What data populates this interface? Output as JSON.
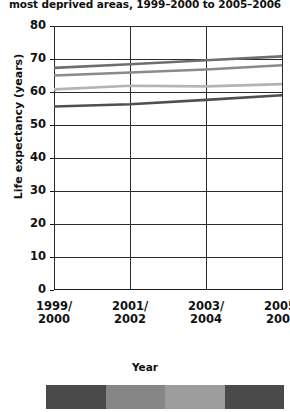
{
  "chart_data": {
    "type": "line",
    "title": "most deprived areas, 1999–2000 to 2005–2006",
    "xlabel": "Year",
    "ylabel": "Life expectancy (years)",
    "categories": [
      "1999/2000",
      "2001/2002",
      "2003/2004",
      "2005/2006"
    ],
    "category_lines": [
      [
        "1999/",
        "2000"
      ],
      [
        "2001/",
        "2002"
      ],
      [
        "2003/",
        "2004"
      ],
      [
        "2005/",
        "2006"
      ]
    ],
    "ylim": [
      0,
      80
    ],
    "yticks": [
      0,
      10,
      20,
      30,
      40,
      50,
      60,
      70,
      80
    ],
    "grid": true,
    "legend_position": "bottom",
    "series": [
      {
        "name": "series-1",
        "color": "#6e6e6e",
        "values": [
          67.3,
          68.4,
          69.6,
          70.8
        ]
      },
      {
        "name": "series-2",
        "color": "#8a8a8a",
        "values": [
          65.0,
          65.9,
          66.8,
          68.1
        ]
      },
      {
        "name": "series-3",
        "color": "#b4b4b4",
        "values": [
          60.8,
          61.9,
          61.7,
          62.4
        ]
      },
      {
        "name": "series-4",
        "color": "#4f4f4f",
        "values": [
          55.6,
          56.3,
          57.6,
          59.0
        ]
      }
    ]
  },
  "legend_swatches": [
    {
      "name": "swatch-1",
      "color": "#4a4a4a"
    },
    {
      "name": "swatch-2",
      "color": "#868686"
    },
    {
      "name": "swatch-3",
      "color": "#9c9c9c"
    },
    {
      "name": "swatch-4",
      "color": "#4a4a4a"
    }
  ]
}
